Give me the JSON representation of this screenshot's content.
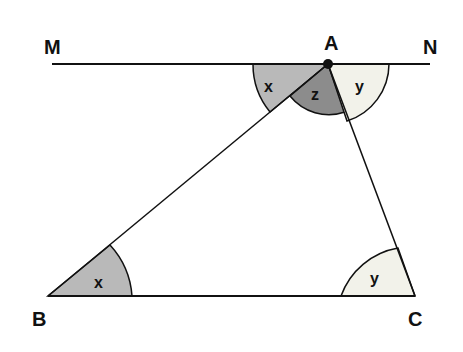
{
  "diagram": {
    "type": "geometry-triangle-parallel-line",
    "points": {
      "M": {
        "label": "M",
        "x": 52,
        "y": 64
      },
      "N": {
        "label": "N",
        "x": 430,
        "y": 64
      },
      "A": {
        "label": "A",
        "x": 328,
        "y": 64
      },
      "B": {
        "label": "B",
        "x": 48,
        "y": 296
      },
      "C": {
        "label": "C",
        "x": 415,
        "y": 296
      }
    },
    "angles": {
      "x_at_A": {
        "label": "x",
        "color": "#b9b9b9"
      },
      "z_at_A": {
        "label": "z",
        "color": "#8c8c8c"
      },
      "y_at_A": {
        "label": "y",
        "color": "#f2f2ea"
      },
      "x_at_B": {
        "label": "x",
        "color": "#b9b9b9"
      },
      "y_at_C": {
        "label": "y",
        "color": "#f2f2ea"
      }
    },
    "colors": {
      "line": "#111111",
      "background": "#ffffff"
    }
  }
}
